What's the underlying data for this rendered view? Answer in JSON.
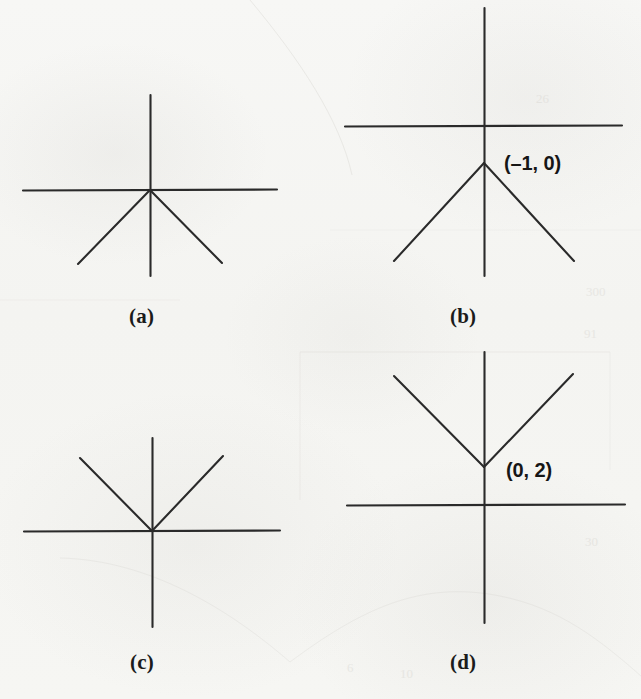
{
  "figure": {
    "kind": "multiple-choice-graph-figure",
    "width": 641,
    "height": 699,
    "background_color": "#f6f6f4",
    "ink_color": "#2a2a2a",
    "panel_count": 4
  },
  "panels": [
    {
      "id": "a",
      "caption": "(a)",
      "caption_x": 129,
      "caption_y": 304,
      "origin_x": 150,
      "origin_y": 190,
      "x_axis": {
        "x1": 23,
        "y1": 190,
        "x2": 277,
        "y2": 190
      },
      "y_axis": {
        "x1": 150,
        "y1": 95,
        "x2": 150,
        "y2": 276
      },
      "graph_shape": "inverted-v",
      "vertex_x": 150,
      "vertex_y": 190,
      "arms": [
        {
          "name": "left-arm",
          "x1": 150,
          "y1": 190,
          "x2": 78,
          "y2": 264
        },
        {
          "name": "right-arm",
          "x1": 150,
          "y1": 190,
          "x2": 222,
          "y2": 263
        }
      ],
      "point_label": null
    },
    {
      "id": "b",
      "caption": "(b)",
      "caption_x": 450,
      "caption_y": 304,
      "origin_x": 484,
      "origin_y": 126,
      "x_axis": {
        "x1": 345,
        "y1": 126,
        "x2": 622,
        "y2": 126
      },
      "y_axis": {
        "x1": 484,
        "y1": 8,
        "x2": 484,
        "y2": 276
      },
      "graph_shape": "inverted-v",
      "vertex_x": 484,
      "vertex_y": 163,
      "arms": [
        {
          "name": "left-arm",
          "x1": 484,
          "y1": 163,
          "x2": 394,
          "y2": 261
        },
        {
          "name": "right-arm",
          "x1": 484,
          "y1": 163,
          "x2": 574,
          "y2": 261
        }
      ],
      "point_label": {
        "text": "(–1, 0)",
        "x": 504,
        "y": 152
      }
    },
    {
      "id": "c",
      "caption": "(c)",
      "caption_x": 130,
      "caption_y": 650,
      "origin_x": 152,
      "origin_y": 531,
      "x_axis": {
        "x1": 24,
        "y1": 531,
        "x2": 280,
        "y2": 531
      },
      "y_axis": {
        "x1": 152,
        "y1": 438,
        "x2": 152,
        "y2": 627
      },
      "graph_shape": "v",
      "vertex_x": 152,
      "vertex_y": 531,
      "arms": [
        {
          "name": "left-arm",
          "x1": 152,
          "y1": 531,
          "x2": 80,
          "y2": 458
        },
        {
          "name": "right-arm",
          "x1": 152,
          "y1": 531,
          "x2": 223,
          "y2": 456
        }
      ],
      "point_label": null
    },
    {
      "id": "d",
      "caption": "(d)",
      "caption_x": 450,
      "caption_y": 650,
      "origin_x": 484,
      "origin_y": 505,
      "x_axis": {
        "x1": 347,
        "y1": 505,
        "x2": 625,
        "y2": 505
      },
      "y_axis": {
        "x1": 484,
        "y1": 352,
        "x2": 484,
        "y2": 623
      },
      "graph_shape": "v",
      "vertex_x": 484,
      "vertex_y": 467,
      "arms": [
        {
          "name": "left-arm",
          "x1": 484,
          "y1": 467,
          "x2": 394,
          "y2": 376
        },
        {
          "name": "right-arm",
          "x1": 484,
          "y1": 467,
          "x2": 573,
          "y2": 374
        }
      ],
      "point_label": {
        "text": "(0, 2)",
        "x": 506,
        "y": 459
      }
    }
  ]
}
